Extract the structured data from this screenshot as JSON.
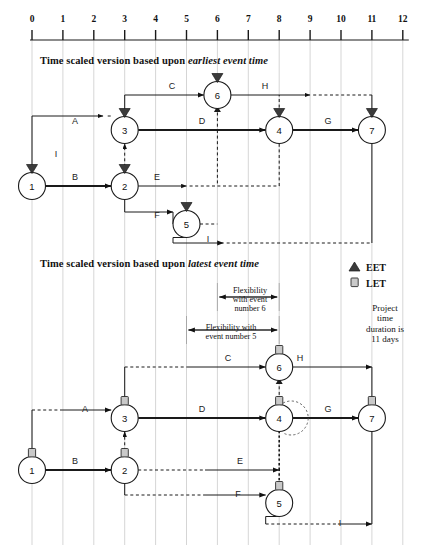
{
  "axis": {
    "name": "time-axis",
    "ticks": [
      "0",
      "1",
      "2",
      "3",
      "4",
      "5",
      "6",
      "7",
      "8",
      "9",
      "10",
      "11",
      "12"
    ],
    "origin_px": 32,
    "step_px": 30.9,
    "y_px": 40
  },
  "titles": {
    "top": {
      "plain": "Time scaled version  based upon ",
      "emph": "earliest event time"
    },
    "bottom": {
      "plain": "Time scaled version  based upon ",
      "emph": "latest event time"
    }
  },
  "legend": {
    "eet_label": "EET",
    "let_label": "LET",
    "eet_marker": "triangle-up-filled",
    "let_marker": "square-outline",
    "note_lines": [
      "Project",
      "time",
      "duration is",
      "11 days"
    ]
  },
  "flexibility": {
    "event6": {
      "lines": [
        "Flexibility",
        "with event",
        "number 6"
      ],
      "from_time": 6,
      "to_time": 8
    },
    "event5": {
      "lines": [
        "Flexibility with",
        "event number 5"
      ],
      "from_time": 5,
      "to_time": 8
    }
  },
  "diagram_top": {
    "marker_type": "EET",
    "nodes": [
      {
        "id": "1",
        "label": "1",
        "time": 0,
        "row": 186
      },
      {
        "id": "2",
        "label": "2",
        "time": 3,
        "row": 186
      },
      {
        "id": "3",
        "label": "3",
        "time": 3,
        "row": 130
      },
      {
        "id": "5",
        "label": "5",
        "time": 5,
        "row": 224
      },
      {
        "id": "6",
        "label": "6",
        "time": 6,
        "row": 95
      },
      {
        "id": "4",
        "label": "4",
        "time": 8,
        "row": 130
      },
      {
        "id": "7",
        "label": "7",
        "time": 11,
        "row": 130
      }
    ],
    "activities": [
      {
        "label": "A",
        "from": "1",
        "to": "3",
        "lx": 75,
        "ly": 122
      },
      {
        "label": "B",
        "from": "1",
        "to": "2",
        "lx": 75,
        "ly": 178
      },
      {
        "label": "C",
        "from": "3",
        "to": "6",
        "lx": 172,
        "ly": 87
      },
      {
        "label": "D",
        "from": "3",
        "to": "4",
        "lx": 202,
        "ly": 122
      },
      {
        "label": "E",
        "from": "2",
        "to": "6",
        "lx": 157,
        "ly": 178
      },
      {
        "label": "F",
        "from": "2",
        "to": "5",
        "lx": 157,
        "ly": 216
      },
      {
        "label": "G",
        "from": "4",
        "to": "7",
        "lx": 328,
        "ly": 122
      },
      {
        "label": "H",
        "from": "6",
        "to": "7",
        "lx": 265,
        "ly": 87
      },
      {
        "label": "I",
        "from": "5",
        "to": "1",
        "lx": 56,
        "ly": 155
      },
      {
        "label": "I",
        "from": "5",
        "to": "7",
        "lx": 208,
        "ly": 240
      }
    ]
  },
  "diagram_bottom": {
    "marker_type": "LET",
    "nodes": [
      {
        "id": "1",
        "label": "1",
        "time": 0,
        "row": 470
      },
      {
        "id": "2",
        "label": "2",
        "time": 3,
        "row": 470
      },
      {
        "id": "3",
        "label": "3",
        "time": 3,
        "row": 418
      },
      {
        "id": "5",
        "label": "5",
        "time": 8,
        "row": 503
      },
      {
        "id": "6",
        "label": "6",
        "time": 8,
        "row": 367
      },
      {
        "id": "4",
        "label": "4",
        "time": 8,
        "row": 418
      },
      {
        "id": "7",
        "label": "7",
        "time": 11,
        "row": 418
      }
    ],
    "activities": [
      {
        "label": "A",
        "from": "1",
        "to": "3",
        "lx": 85,
        "ly": 410
      },
      {
        "label": "B",
        "from": "1",
        "to": "2",
        "lx": 75,
        "ly": 462
      },
      {
        "label": "C",
        "from": "3",
        "to": "6",
        "lx": 228,
        "ly": 359
      },
      {
        "label": "D",
        "from": "3",
        "to": "4",
        "lx": 202,
        "ly": 410
      },
      {
        "label": "E",
        "from": "2",
        "to": "6",
        "lx": 240,
        "ly": 462
      },
      {
        "label": "F",
        "from": "2",
        "to": "5",
        "lx": 238,
        "ly": 495
      },
      {
        "label": "G",
        "from": "4",
        "to": "7",
        "lx": 328,
        "ly": 410
      },
      {
        "label": "H",
        "from": "6",
        "to": "7",
        "lx": 300,
        "ly": 359
      },
      {
        "label": "I",
        "from": "5",
        "to": "7",
        "lx": 340,
        "ly": 524
      }
    ]
  }
}
